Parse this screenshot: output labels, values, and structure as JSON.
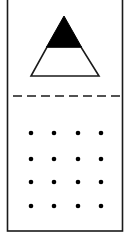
{
  "figure": {
    "colors": {
      "stroke": "#1a1a1a",
      "fill_dark": "#000000",
      "background": "#ffffff"
    },
    "card": {
      "left": 7.5,
      "top": -2,
      "right": 122.5,
      "bottom": 231
    },
    "triangle": {
      "apex": [
        64,
        16
      ],
      "base_left": [
        31,
        76
      ],
      "base_right": [
        99,
        76
      ],
      "black_until_y": 47
    },
    "fold_line": {
      "y": 96,
      "x1": 13,
      "x2": 123,
      "style": "dashed"
    },
    "dots": {
      "cols_x": [
        31,
        54,
        78,
        101
      ],
      "rows_y": [
        133,
        159,
        182,
        206
      ],
      "radius": 2.3
    }
  }
}
